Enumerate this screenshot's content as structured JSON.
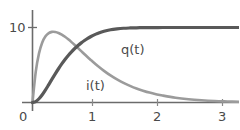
{
  "figure": {
    "background_color": "#ffffff",
    "width": 239,
    "height": 130
  },
  "axes": {
    "axis_color": "#6b6b6b",
    "x_tick_labels": [
      "0",
      "1",
      "2",
      "3"
    ],
    "x_tick_values": [
      0,
      1,
      2,
      3
    ],
    "y_tick_labels": [
      "10"
    ],
    "y_tick_values": [
      10
    ]
  },
  "labels": {
    "q_label": "q(t)",
    "i_label": "i(t)"
  },
  "chart_data": {
    "type": "line",
    "title": "",
    "subtitle": "",
    "xlabel": "",
    "ylabel": "",
    "xlim": [
      -0.15,
      3.2
    ],
    "ylim": [
      0,
      11.2
    ],
    "xticks": [
      0,
      1,
      2,
      3
    ],
    "xticklabels": [
      "0",
      "1",
      "2",
      "3"
    ],
    "yticks": [
      10
    ],
    "yticklabels": [
      "10"
    ],
    "grid": false,
    "legend": "inline-annotations",
    "annotations": [
      {
        "text": "q(t)",
        "x": 1.53,
        "y": 7.05
      },
      {
        "text": "i(t)",
        "x": 0.99,
        "y": 2.85
      }
    ],
    "x": [
      0,
      0.05,
      0.1,
      0.15,
      0.2,
      0.25,
      0.3,
      0.35,
      0.4,
      0.45,
      0.5,
      0.55,
      0.6,
      0.65,
      0.7,
      0.75,
      0.8,
      0.85,
      0.9,
      0.95,
      1.0,
      1.1,
      1.2,
      1.3,
      1.4,
      1.5,
      1.6,
      1.7,
      1.8,
      1.9,
      2.0,
      2.2,
      2.4,
      2.6,
      2.8,
      3.0,
      3.2
    ],
    "series": [
      {
        "name": "q(t)",
        "color": "#595959",
        "linewidth": 3.2,
        "description": "charging curve rising from 0 and saturating at 10",
        "values": [
          0.0,
          0.13,
          0.5,
          1.03,
          1.68,
          2.39,
          3.11,
          3.82,
          4.5,
          5.14,
          5.73,
          6.27,
          6.76,
          7.2,
          7.6,
          7.95,
          8.27,
          8.55,
          8.8,
          9.02,
          9.2,
          9.5,
          9.7,
          9.82,
          9.9,
          9.94,
          9.96,
          9.98,
          9.99,
          9.99,
          10.0,
          10.0,
          10.0,
          10.0,
          10.0,
          10.0,
          10.0
        ]
      },
      {
        "name": "i(t)",
        "color": "#9b9b9b",
        "linewidth": 2.6,
        "description": "current curve rising steeply to a peak near t=0.45 then decaying toward 0",
        "values": [
          0.0,
          4.1,
          6.55,
          8.0,
          8.82,
          9.25,
          9.42,
          9.4,
          9.27,
          9.05,
          8.76,
          8.42,
          8.05,
          7.66,
          7.26,
          6.85,
          6.44,
          6.04,
          5.65,
          5.27,
          4.9,
          4.22,
          3.61,
          3.08,
          2.62,
          2.22,
          1.87,
          1.58,
          1.32,
          1.11,
          0.93,
          0.64,
          0.44,
          0.3,
          0.2,
          0.14,
          0.09
        ]
      }
    ]
  }
}
